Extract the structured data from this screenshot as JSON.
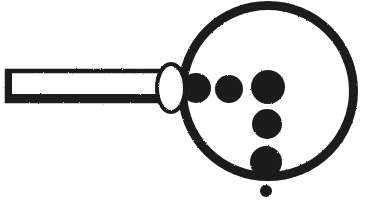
{
  "figure": {
    "alt_text": "Black line drawing of a magnifying glass pointing up-right, its round lens containing six solid black dots of different sizes",
    "canvas": {
      "width": 376,
      "height": 207
    },
    "colors": {
      "ink": "#1a1a1a",
      "paper": "#ffffff"
    },
    "style": "monochrome line art, hand-inked, rough edges"
  },
  "parts": {
    "lens_ring": {
      "label": "lens-ring",
      "shape": "circle-outline",
      "center_x": 268,
      "center_y": 91,
      "outer_radius": 90,
      "stroke_width": 9
    },
    "collar": {
      "label": "collar-ferrule",
      "shape": "ellipse-outline",
      "center_x": 171,
      "center_y": 88,
      "radius_x": 14,
      "radius_y": 24,
      "stroke_width": 4,
      "fill": "#ffffff"
    },
    "handle": {
      "label": "handle",
      "shape": "rectangle-outline",
      "x": 5,
      "y": 70,
      "width": 166,
      "height": 32,
      "stroke_width": 4,
      "bottom_edge_thicker": true
    }
  },
  "dots": [
    {
      "name": "dot-1",
      "cx": 196,
      "cy": 88,
      "r": 15,
      "size": "medium",
      "note": "overlaps left edge of lens ring"
    },
    {
      "name": "dot-2",
      "cx": 229,
      "cy": 89,
      "r": 14,
      "size": "medium"
    },
    {
      "name": "dot-3",
      "cx": 268,
      "cy": 87,
      "r": 17,
      "size": "large"
    },
    {
      "name": "dot-4",
      "cx": 267,
      "cy": 124,
      "r": 15,
      "size": "medium"
    },
    {
      "name": "dot-5",
      "cx": 266,
      "cy": 162,
      "r": 16,
      "size": "large",
      "note": "overlaps bottom edge of lens ring"
    },
    {
      "name": "dot-6",
      "cx": 266,
      "cy": 191,
      "r": 6,
      "size": "tiny",
      "note": "sits outside lens, below the ring"
    }
  ],
  "counts": {
    "dot_total": 6
  }
}
